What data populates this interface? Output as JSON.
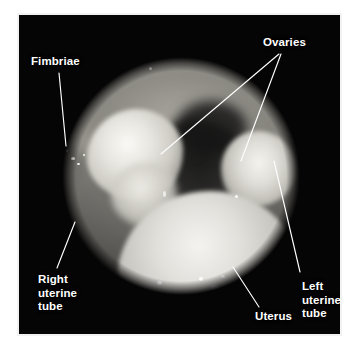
{
  "figure": {
    "kind": "laparoscopic-photograph",
    "background_color": "#ffffff",
    "mount_color": "#f2f2f2",
    "photo_background": "#050505",
    "label_color": "#ffffff",
    "leader_color": "#ffffff"
  },
  "labels": [
    {
      "id": "fimbriae",
      "text": "Fimbriae",
      "lines": [
        "Fimbriae"
      ],
      "align": "left",
      "x": 12,
      "y": 40,
      "leaders": [
        {
          "x1": 40,
          "y1": 58,
          "x2": 47,
          "y2": 131
        }
      ]
    },
    {
      "id": "ovaries",
      "text": "Ovaries",
      "lines": [
        "Ovaries"
      ],
      "align": "left",
      "x": 244,
      "y": 21,
      "leaders": [
        {
          "x1": 260,
          "y1": 39,
          "x2": 142,
          "y2": 139
        },
        {
          "x1": 262,
          "y1": 39,
          "x2": 222,
          "y2": 146
        }
      ]
    },
    {
      "id": "right-uterine-tube",
      "text": "Right uterine tube",
      "lines": [
        "Right",
        "uterine",
        "tube"
      ],
      "align": "left",
      "x": 19,
      "y": 258,
      "leaders": [
        {
          "x1": 38,
          "y1": 253,
          "x2": 56,
          "y2": 207
        }
      ]
    },
    {
      "id": "left-uterine-tube",
      "text": "Left uterine tube",
      "lines": [
        "Left",
        "uterine",
        "tube"
      ],
      "align": "left",
      "x": 283,
      "y": 265,
      "leaders": [
        {
          "x1": 281,
          "y1": 257,
          "x2": 255,
          "y2": 146
        }
      ]
    },
    {
      "id": "uterus",
      "text": "Uterus",
      "lines": [
        "Uterus"
      ],
      "align": "left",
      "x": 236,
      "y": 295,
      "leaders": [
        {
          "x1": 240,
          "y1": 292,
          "x2": 214,
          "y2": 252
        }
      ]
    }
  ],
  "anatomy": {
    "structures": [
      "uterus",
      "right ovary",
      "left ovary",
      "right uterine tube",
      "left uterine tube",
      "fimbriae"
    ]
  }
}
